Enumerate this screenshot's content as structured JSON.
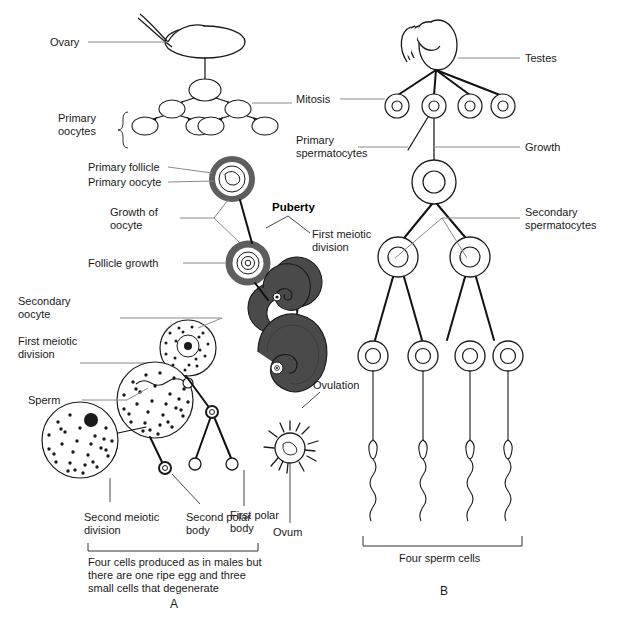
{
  "figure": {
    "title_fragment": "",
    "panel_a_letter": "A",
    "panel_b_letter": "B"
  },
  "oogenesis": {
    "labels": {
      "ovary": "Ovary",
      "primary_oocytes": "Primary\noocytes",
      "primary_oocytes_l1": "Primary",
      "primary_oocytes_l2": "oocytes",
      "primary_follicle": "Primary follicle",
      "primary_oocyte": "Primary oocyte",
      "growth_of_oocyte_l1": "Growth of",
      "growth_of_oocyte_l2": "oocyte",
      "follicle_growth": "Follicle growth",
      "secondary_oocyte_l1": "Secondary",
      "secondary_oocyte_l2": "oocyte",
      "first_meiotic_division_l1": "First meiotic",
      "first_meiotic_division_l2": "division",
      "sperm": "Sperm",
      "ovulation": "Ovulation",
      "ovum": "Ovum",
      "first_polar_body_l1": "First polar",
      "first_polar_body_l2": "body",
      "second_meiotic_division_l1": "Second meiotic",
      "second_meiotic_division_l2": "division",
      "second_polar_body_l1": "Second polar",
      "second_polar_body_l2": "body",
      "puberty": "Puberty"
    },
    "caption_l1": "Four cells produced as in males but",
    "caption_l2": "there are one ripe egg and three",
    "caption_l3": "small cells that degenerate"
  },
  "spermatogenesis": {
    "labels": {
      "testes": "Testes",
      "mitosis": "Mitosis",
      "primary_spermatocytes_l1": "Primary",
      "primary_spermatocytes_l2": "spermatocytes",
      "growth": "Growth",
      "secondary_spermatocytes_l1": "Secondary",
      "secondary_spermatocytes_l2": "spermatocytes",
      "four_sperm_cells": "Four sperm cells"
    }
  },
  "colors": {
    "ink": "#1a1a1a",
    "leader": "#8a8a8a",
    "follicle_gray": "#5e5e5e",
    "dark_follicle": "#4a4a4a",
    "background": "#ffffff"
  }
}
